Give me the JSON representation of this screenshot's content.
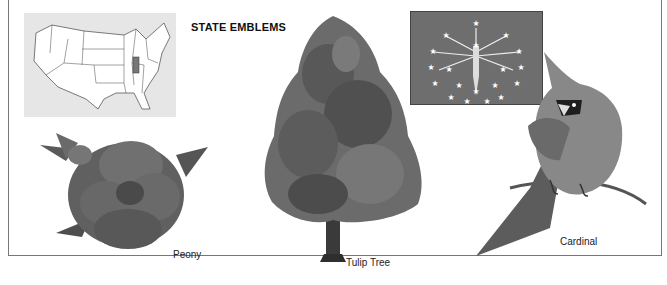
{
  "page": {
    "title": "STATE EMBLEMS"
  },
  "emblems": {
    "map": {
      "label": "",
      "highlighted_state": "Indiana",
      "highlight_color": "#777777"
    },
    "flag": {
      "label": "",
      "color": "#6e6e6e",
      "star_count": 19
    },
    "flower": {
      "label": "Peony"
    },
    "tree": {
      "label": "Tulip Tree"
    },
    "bird": {
      "label": "Cardinal"
    }
  }
}
